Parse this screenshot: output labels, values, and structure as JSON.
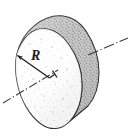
{
  "figure": {
    "kind": "technical-illustration",
    "background_color": "#ffffff",
    "outline_color": "#2b2b2b",
    "rim_fill_color": "#b9b9b9",
    "face_fill_color": "#fdfdfd",
    "stipple_color": "#8c8c8c",
    "leader_line_color": "#3a3a3a",
    "labels": {
      "radius": "R"
    },
    "annotations": {
      "radius_arrow_name": "radius-dimension-arrow",
      "axis_line_name": "center-axis-dash-dot-line",
      "edge_leader_name": "rim-leader-line"
    }
  }
}
